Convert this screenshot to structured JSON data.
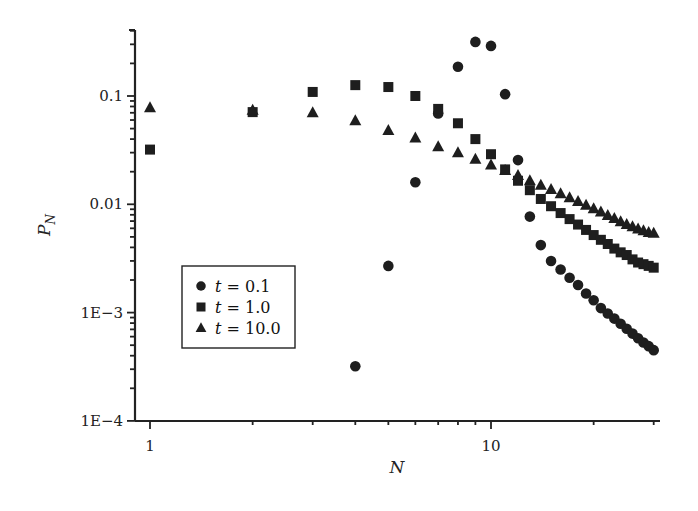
{
  "chart_data": {
    "type": "scatter",
    "title": "",
    "xlabel": "N",
    "ylabel": "P_N",
    "xscale": "log",
    "yscale": "log",
    "xlim": [
      0.9,
      31
    ],
    "ylim": [
      0.0001,
      0.4
    ],
    "x_ticks": [
      {
        "value": 1,
        "label": "1"
      },
      {
        "value": 10,
        "label": "10"
      }
    ],
    "y_ticks": [
      {
        "value": 0.0001,
        "label": "1E−4"
      },
      {
        "value": 0.001,
        "label": "1E−3"
      },
      {
        "value": 0.01,
        "label": "0.01"
      },
      {
        "value": 0.1,
        "label": "0.1"
      }
    ],
    "grid": false,
    "legend_position": "lower-left inside",
    "series": [
      {
        "name": "t = 0.1",
        "t_label": "t",
        "value_label": "= 0.1",
        "marker": "circle",
        "x": [
          4,
          5,
          6,
          7,
          8,
          9,
          10,
          11,
          12,
          13,
          14,
          15,
          16,
          17,
          18,
          19,
          20,
          21,
          22,
          23,
          24,
          25,
          26,
          27,
          28,
          29,
          30
        ],
        "values": [
          0.00032,
          0.0027,
          0.016,
          0.069,
          0.186,
          0.316,
          0.29,
          0.104,
          0.0256,
          0.0077,
          0.0042,
          0.003,
          0.0025,
          0.0021,
          0.0018,
          0.0015,
          0.0013,
          0.0011,
          0.00098,
          0.00088,
          0.00079,
          0.00071,
          0.00064,
          0.00058,
          0.00053,
          0.00049,
          0.00045
        ]
      },
      {
        "name": "t = 1.0",
        "t_label": "t",
        "value_label": "= 1.0",
        "marker": "square",
        "x": [
          1,
          2,
          3,
          4,
          5,
          6,
          7,
          8,
          9,
          10,
          11,
          12,
          13,
          14,
          15,
          16,
          17,
          18,
          19,
          20,
          21,
          22,
          23,
          24,
          25,
          26,
          27,
          28,
          29,
          30
        ],
        "values": [
          0.032,
          0.071,
          0.109,
          0.126,
          0.121,
          0.1,
          0.076,
          0.056,
          0.04,
          0.029,
          0.021,
          0.0165,
          0.0135,
          0.0112,
          0.0096,
          0.0083,
          0.0073,
          0.0065,
          0.0058,
          0.0052,
          0.0047,
          0.0043,
          0.0039,
          0.0036,
          0.0034,
          0.0031,
          0.0029,
          0.0028,
          0.0027,
          0.0026
        ]
      },
      {
        "name": "t = 10.0",
        "t_label": "t",
        "value_label": "= 10.0",
        "marker": "triangle",
        "x": [
          1,
          2,
          3,
          4,
          5,
          6,
          7,
          8,
          9,
          10,
          11,
          12,
          13,
          14,
          15,
          16,
          17,
          18,
          19,
          20,
          21,
          22,
          23,
          24,
          25,
          26,
          27,
          28,
          29,
          30
        ],
        "values": [
          0.078,
          0.074,
          0.07,
          0.059,
          0.048,
          0.041,
          0.034,
          0.03,
          0.026,
          0.023,
          0.0205,
          0.0184,
          0.0165,
          0.015,
          0.0137,
          0.0125,
          0.0115,
          0.0106,
          0.0098,
          0.0091,
          0.0085,
          0.0079,
          0.0074,
          0.0069,
          0.0065,
          0.0062,
          0.0059,
          0.0057,
          0.0055,
          0.0054
        ]
      }
    ]
  }
}
